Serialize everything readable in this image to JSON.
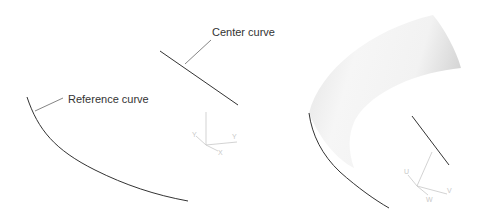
{
  "figure": {
    "left_panel": {
      "labels": {
        "center_curve": "Center curve",
        "reference_curve": "Reference curve"
      },
      "triad": {
        "axis_labels": [
          "Y",
          "X",
          "Y",
          "X"
        ]
      }
    },
    "right_panel": {
      "description": "swept surface",
      "triad": {
        "axis_labels": [
          "U",
          "V",
          "V",
          "W"
        ]
      }
    },
    "colors": {
      "curve": "#333333",
      "leader": "#666666",
      "triad": "#c8c8c8",
      "surface_light": "#f7f7f7",
      "surface_dark": "#d4d4d4"
    }
  }
}
